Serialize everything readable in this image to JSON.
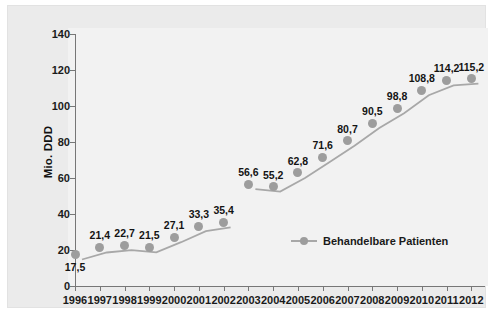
{
  "chart_data": {
    "type": "line",
    "title": "",
    "xlabel": "",
    "ylabel": "Mio. DDD",
    "categories": [
      "1996",
      "1997",
      "1998",
      "1999",
      "2000",
      "2001",
      "2002",
      "2003",
      "2004",
      "2005",
      "2006",
      "2007",
      "2008",
      "2009",
      "2010",
      "2011",
      "2012"
    ],
    "values": [
      17.5,
      21.4,
      22.7,
      21.5,
      27.1,
      33.3,
      35.4,
      56.6,
      55.2,
      62.8,
      71.6,
      80.7,
      90.5,
      98.8,
      108.8,
      114.2,
      115.2
    ],
    "point_labels": [
      "17,5",
      "21,4",
      "22,7",
      "21,5",
      "27,1",
      "33,3",
      "35,4",
      "56,6",
      "55,2",
      "62,8",
      "71,6",
      "80,7",
      "90,5",
      "98,8",
      "108,8",
      "114,2",
      "115,2"
    ],
    "label_positions": [
      "below",
      "above",
      "above",
      "above",
      "above",
      "above",
      "above",
      "above",
      "above",
      "above",
      "above",
      "above",
      "above",
      "above",
      "above",
      "above",
      "above"
    ],
    "ylim": [
      0,
      140
    ],
    "yticks": [
      0,
      20,
      40,
      60,
      80,
      100,
      120,
      140
    ],
    "ytick_labels": [
      "0",
      "20",
      "40",
      "60",
      "80",
      "100",
      "120",
      "140"
    ],
    "grid": false,
    "legend": {
      "position": "inside-bottom-center",
      "entries": [
        {
          "name": "Behandelbare Patienten",
          "marker": "circle",
          "color": "#9d9d9d"
        }
      ]
    },
    "series_color": "#a8a8a8",
    "marker_color": "#9d9d9d",
    "gap_after_index": 6,
    "colors": {
      "panel_background": "#ebebeb",
      "plot_background": "#f2f2f2",
      "axis": "#777777",
      "text": "#1a1a1a"
    }
  }
}
